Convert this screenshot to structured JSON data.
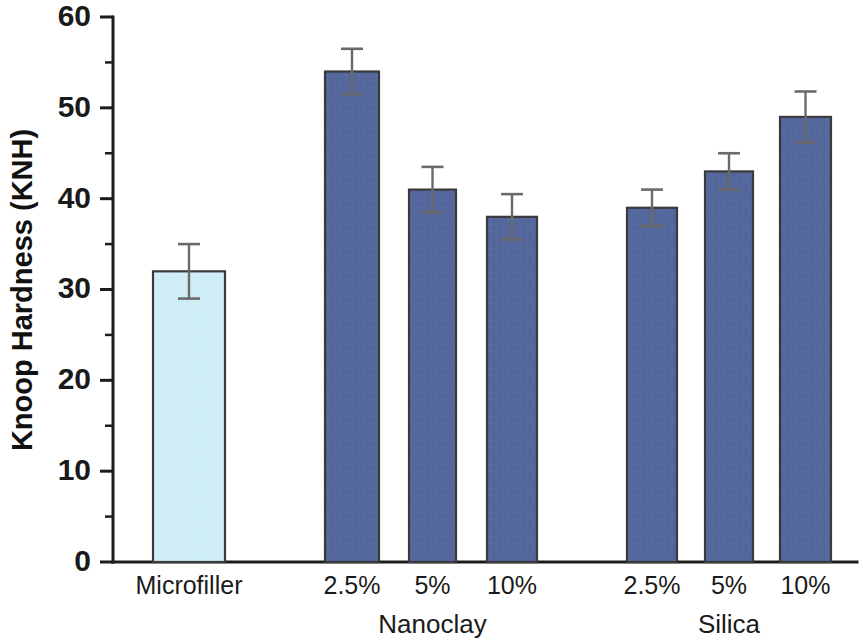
{
  "chart_data": {
    "type": "bar",
    "title": "",
    "xlabel": "",
    "ylabel": "Knoop Hardness (KNH)",
    "ylim": [
      0,
      60
    ],
    "ytick_labels": [
      "0",
      "10",
      "20",
      "30",
      "40",
      "50",
      "60"
    ],
    "ytick_values": [
      0,
      10,
      20,
      30,
      40,
      50,
      60
    ],
    "yminor_values": [
      5,
      15,
      25,
      35,
      45,
      55
    ],
    "grid": false,
    "legend": "none",
    "categories": [
      "Microfiller",
      "2.5%",
      "5%",
      "10%",
      "2.5%",
      "5%",
      "10%"
    ],
    "values": [
      32,
      54,
      41,
      38,
      39,
      43,
      49
    ],
    "errors": [
      3,
      2.5,
      2.5,
      2.5,
      2,
      2,
      2.8
    ],
    "bars": [
      {
        "label": "Microfiller",
        "group": "",
        "value": 32,
        "error": 3,
        "color": "#cfeef7"
      },
      {
        "label": "2.5%",
        "group": "Nanoclay",
        "value": 54,
        "error": 2.5,
        "color": "#54689e"
      },
      {
        "label": "5%",
        "group": "Nanoclay",
        "value": 41,
        "error": 2.5,
        "color": "#54689e"
      },
      {
        "label": "10%",
        "group": "Nanoclay",
        "value": 38,
        "error": 2.5,
        "color": "#54689e"
      },
      {
        "label": "2.5%",
        "group": "Silica",
        "value": 39,
        "error": 2,
        "color": "#54689e"
      },
      {
        "label": "5%",
        "group": "Silica",
        "value": 43,
        "error": 2,
        "color": "#54689e"
      },
      {
        "label": "10%",
        "group": "Silica",
        "value": 49,
        "error": 2.8,
        "color": "#54689e"
      }
    ],
    "group_labels": [
      {
        "text": "Nanoclay",
        "center_index": 2
      },
      {
        "text": "Silica",
        "center_index": 5
      }
    ],
    "colors": {
      "microfiller_fill": "#cfeef7",
      "nano_silica_fill": "#54689e",
      "bar_stroke": "#3a3a3a",
      "axis": "#1c1c1c",
      "error_bar": "#6a6a6a",
      "background": "#ffffff"
    }
  }
}
